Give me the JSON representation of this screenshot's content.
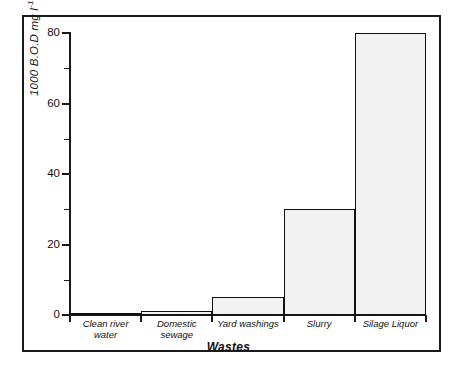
{
  "chart_data": {
    "type": "bar",
    "title": "",
    "subtitle": "",
    "xlabel": "Wastes",
    "ylabel": "1000 B.O.D mg l⁻¹ Oxygen",
    "ylabel_parts": {
      "main": "1000 B.O.D mg l",
      "superscript": "-1",
      "tail": " Oxygen"
    },
    "categories": [
      "Clean river water",
      "Domestic sewage",
      "Yard washings",
      "Slurry",
      "Silage Liquor"
    ],
    "category_lines": [
      [
        "Clean river",
        "water"
      ],
      [
        "Domestic",
        "sewage"
      ],
      [
        "Yard  washings",
        ""
      ],
      [
        "Slurry",
        ""
      ],
      [
        "Silage  Liquor",
        ""
      ]
    ],
    "values": [
      0,
      1,
      5,
      30,
      80
    ],
    "ylim": [
      0,
      80
    ],
    "xlim_note": "categorical, contiguous bars",
    "ytick_major": [
      0,
      20,
      40,
      60,
      80
    ],
    "ytick_major_labels": [
      "0",
      "20",
      "40",
      "60",
      "80"
    ],
    "ytick_minor": [
      10,
      30,
      50,
      70
    ],
    "grid": false,
    "legend": null,
    "bar_fill": "stipple-dot-pattern",
    "bar_edge_color": "#111111",
    "bar_fill_color": "#f2f2f2",
    "frame_color": "#1a1a1a",
    "background_color": "#ffffff"
  }
}
